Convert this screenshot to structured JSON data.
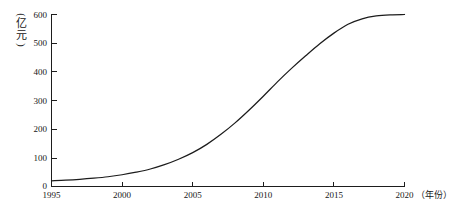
{
  "chart_data": {
    "type": "line",
    "title": "",
    "subtitle": "",
    "xlabel": "年份",
    "ylabel": "亿元",
    "xlabel_display": "（年份）",
    "ylabel_display": "（亿元）",
    "ylabel_open_paren": "(",
    "ylabel_close_paren": ")",
    "ylabel_char_1": "亿",
    "ylabel_char_2": "元",
    "grid": false,
    "legend": false,
    "legend_position": "none",
    "xlim": [
      1995,
      2020
    ],
    "ylim": [
      0,
      600
    ],
    "xticks": [
      1995,
      2000,
      2005,
      2010,
      2015,
      2020
    ],
    "xtick_labels": [
      "1995",
      "2000",
      "2005",
      "2010",
      "2015",
      "2020"
    ],
    "yticks": [
      0,
      100,
      200,
      300,
      400,
      500,
      600
    ],
    "ytick_labels": [
      "0",
      "100",
      "200",
      "300",
      "400",
      "500",
      "600"
    ],
    "series": [
      {
        "name": "产值",
        "color": "#1c1c1c",
        "x": [
          1995,
          1996,
          1997,
          1998,
          1999,
          2000,
          2001,
          2002,
          2003,
          2004,
          2005,
          2006,
          2007,
          2008,
          2009,
          2010,
          2011,
          2012,
          2013,
          2014,
          2015,
          2016,
          2017,
          2018,
          2019,
          2020
        ],
        "values": [
          20,
          22,
          25,
          29,
          34,
          41,
          50,
          61,
          76,
          95,
          118,
          147,
          182,
          222,
          267,
          315,
          365,
          412,
          456,
          498,
          535,
          566,
          585,
          595,
          599,
          600
        ]
      }
    ],
    "annotations": []
  },
  "axes": {
    "y_axis_name": "y-axis",
    "x_axis_name": "x-axis"
  }
}
